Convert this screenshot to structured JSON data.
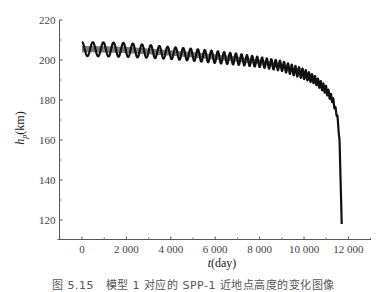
{
  "chart_data": {
    "type": "line",
    "title": "",
    "xlabel": "t(day)",
    "xlabel_parts": {
      "var": "t",
      "unit": "(day)"
    },
    "ylabel": "h_p(km)",
    "ylabel_parts": {
      "var": "h",
      "sub": "p",
      "unit": "(km)"
    },
    "xlim": [
      -1000,
      13000
    ],
    "ylim": [
      110,
      220
    ],
    "xticks": [
      0,
      2000,
      4000,
      6000,
      8000,
      10000,
      12000
    ],
    "xtick_labels": [
      "0",
      "2 000",
      "4 000",
      "6 000",
      "8 000",
      "10 000",
      "12 000"
    ],
    "yticks": [
      120,
      140,
      160,
      180,
      200,
      220
    ],
    "ytick_labels": [
      "120",
      "140",
      "160",
      "180",
      "200",
      "220"
    ],
    "grid": false,
    "legend": null,
    "series": [
      {
        "name": "perigee height",
        "color": "#111111",
        "description": "Oscillating perigee altitude decaying over time; rapid fall near 11700 days",
        "envelope": {
          "t": [
            0,
            1000,
            2000,
            3000,
            4000,
            5000,
            6000,
            7000,
            8000,
            9000,
            10000,
            10500,
            11000,
            11300,
            11500,
            11600,
            11700
          ],
          "center": [
            205.5,
            205.3,
            205.0,
            204.3,
            203.5,
            202.6,
            201.5,
            200.4,
            199.0,
            197.0,
            193.0,
            190.0,
            185.0,
            180.0,
            172.0,
            160.0,
            118.0
          ],
          "amplitude": [
            3.5,
            3.5,
            3.5,
            3.2,
            3.0,
            3.0,
            3.0,
            2.8,
            2.5,
            2.5,
            2.5,
            2.0,
            2.0,
            1.5,
            1.0,
            0.5,
            0.0
          ]
        },
        "period_days_initial": 500,
        "period_days_final": 90
      }
    ]
  },
  "caption": "图 5.15　模型 1 对应的 SPP-1 近地点高度的变化图像"
}
